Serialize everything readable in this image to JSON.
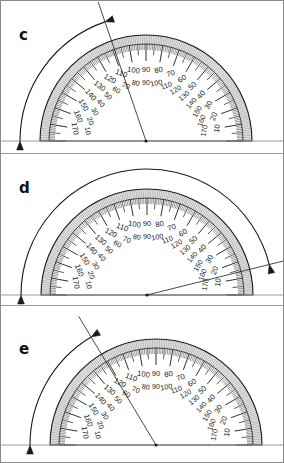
{
  "figure": {
    "type": "protractor-angle-measurement-worksheet",
    "panel_count": 3,
    "background_color": "#ffffff",
    "ink_color": "#1a1a1a",
    "frame_color": "#8a8a8a"
  },
  "scale": {
    "outer_labels": [
      "10",
      "20",
      "30",
      "40",
      "50",
      "60",
      "70",
      "80",
      "90",
      "100",
      "110",
      "120",
      "130",
      "140",
      "150",
      "160",
      "170"
    ],
    "inner_labels": [
      "170",
      "160",
      "150",
      "140",
      "130",
      "120",
      "110",
      "100",
      "90",
      "80",
      "70",
      "60",
      "50",
      "40",
      "30",
      "20",
      "10"
    ],
    "tick_interval_degrees": 1,
    "major_tick_interval_degrees": 10,
    "minor_tick_interval_degrees": 5,
    "range_degrees": [
      0,
      180
    ]
  },
  "panels": [
    {
      "label": "c",
      "label_x": 18,
      "label_y": 34,
      "center_x": 145,
      "baseline_y": 140,
      "radius": 106,
      "arc_radius": 126,
      "ray_angle_degrees": 109,
      "arrow_sweep_start_degrees": 180,
      "arrow_sweep_end_degrees": 109,
      "arrow_direction": "counterclockwise-from-left",
      "panel_top": 1,
      "panel_height": 151
    },
    {
      "label": "d",
      "label_x": 18,
      "label_y": 188,
      "center_x": 146,
      "baseline_y": 293,
      "radius": 106,
      "arc_radius": 126,
      "ray_angle_degrees": 14,
      "arrow_sweep_start_degrees": 180,
      "arrow_sweep_end_degrees": 14,
      "arrow_direction": "counterclockwise-from-left",
      "panel_top": 152,
      "panel_height": 152
    },
    {
      "label": "e",
      "label_x": 18,
      "label_y": 348,
      "center_x": 155,
      "baseline_y": 443,
      "radius": 106,
      "arc_radius": 126,
      "ray_angle_degrees": 121,
      "arrow_sweep_start_degrees": 180,
      "arrow_sweep_end_degrees": 121,
      "arrow_direction": "counterclockwise-from-left",
      "panel_top": 304,
      "panel_height": 158
    }
  ]
}
